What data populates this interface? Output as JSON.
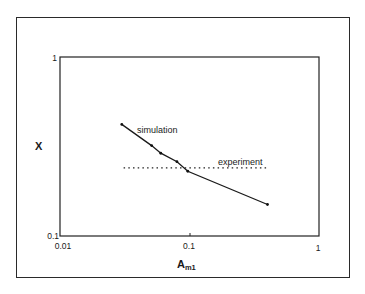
{
  "chart_data": {
    "type": "line",
    "title": "",
    "xlabel": "A",
    "xlabel_sub": "m1",
    "ylabel": "X",
    "xscale": "log",
    "yscale": "log",
    "xlim": [
      0.01,
      1
    ],
    "ylim": [
      0.1,
      1
    ],
    "x_ticks": [
      "0.01",
      "0.1",
      "1"
    ],
    "y_ticks": [
      "0.1",
      "1"
    ],
    "grid": false,
    "legend": "inline labels",
    "series": [
      {
        "name": "simulation",
        "style": "solid line with dot markers",
        "x": [
          0.03,
          0.051,
          0.06,
          0.08,
          0.097,
          0.4
        ],
        "y": [
          0.42,
          0.32,
          0.29,
          0.26,
          0.23,
          0.15
        ]
      },
      {
        "name": "experiment",
        "style": "dotted horizontal line",
        "x": [
          0.031,
          0.4
        ],
        "y": [
          0.24,
          0.24
        ]
      }
    ],
    "annotations": [
      "simulation",
      "experiment"
    ]
  },
  "labels": {
    "ylabel": "X",
    "xlabel_main": "A",
    "xlabel_sub": "m1",
    "sim": "simulation",
    "exp": "experiment",
    "xt0": "0.01",
    "xt1": "0.1",
    "xt2": "1",
    "yt0": "0.1",
    "yt1": "1"
  }
}
